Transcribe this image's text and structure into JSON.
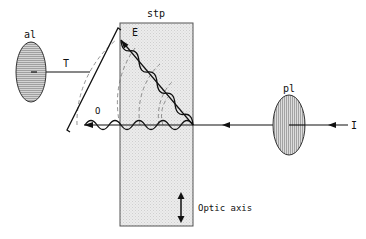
{
  "diagram": {
    "labels": {
      "analyzer": "al",
      "polarizer": "pl",
      "plate": "stp",
      "extraordinary_ray": "E",
      "ordinary_ray": "O",
      "transmitted_ray": "T",
      "incident_ray": "I",
      "optic_axis": "Optic axis"
    },
    "colors": {
      "line": "#111111",
      "plate_fill": "#e6e6e6",
      "lens_fill": "#d8d8d8",
      "hatch": "#9a9a9a",
      "dashed": "#777777"
    }
  }
}
